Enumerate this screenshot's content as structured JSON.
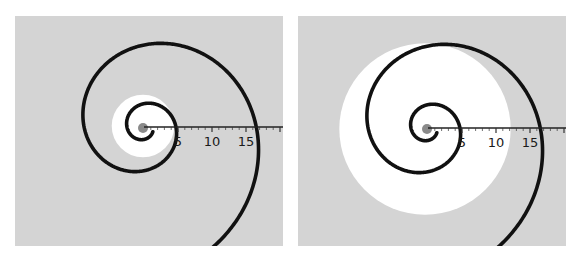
{
  "figure": {
    "colors": {
      "background_panel": "#d4d4d4",
      "highlight_disc": "#ffffff",
      "spiral": "#111111",
      "core": "#8a8a8a"
    },
    "panels": [
      {
        "id": "left",
        "highlight_radius_units": 4.6,
        "scale": {
          "ticks": [
            "5",
            "10",
            "15"
          ],
          "tick_values": [
            5,
            10,
            15
          ],
          "max": 20
        }
      },
      {
        "id": "right",
        "highlight_radius_units": 12.6,
        "scale": {
          "ticks": [
            "5",
            "10",
            "15"
          ],
          "tick_values": [
            5,
            10,
            15
          ],
          "max": 20
        }
      }
    ]
  }
}
